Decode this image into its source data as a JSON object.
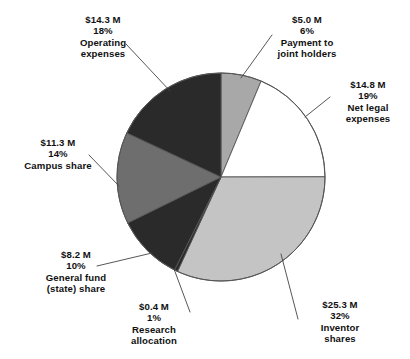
{
  "chart_data": {
    "type": "pie",
    "title": "",
    "subtitle": "",
    "xlabel": "",
    "ylabel": "",
    "legend_position": "callout-labels",
    "grid": false,
    "units": "$ millions",
    "start_angle_deg": 0,
    "direction": "clockwise",
    "categories": [
      "Payment to joint holders",
      "Net legal expenses",
      "Inventor shares",
      "Research allocation",
      "General fund (state) share",
      "Campus share",
      "Operating expenses"
    ],
    "values": [
      5.0,
      14.8,
      25.3,
      0.4,
      8.2,
      11.3,
      14.3
    ],
    "percentages": [
      6,
      19,
      32,
      1,
      10,
      14,
      18
    ],
    "colors": [
      "#a8a8a8",
      "#ffffff",
      "#c4c4c4",
      "#2a2a2a",
      "#2a2a2a",
      "#6e6e6e",
      "#2a2a2a"
    ],
    "slices": [
      {
        "name": "Payment to joint holders",
        "value": 5.0,
        "value_label": "$5.0 M",
        "percent": 6,
        "percent_label": "6%",
        "color": "#a8a8a8"
      },
      {
        "name": "Net legal expenses",
        "value": 14.8,
        "value_label": "$14.8 M",
        "percent": 19,
        "percent_label": "19%",
        "color": "#ffffff"
      },
      {
        "name": "Inventor shares",
        "value": 25.3,
        "value_label": "$25.3 M",
        "percent": 32,
        "percent_label": "32%",
        "color": "#c4c4c4"
      },
      {
        "name": "Research allocation",
        "value": 0.4,
        "value_label": "$0.4 M",
        "percent": 1,
        "percent_label": "1%",
        "color": "#2a2a2a"
      },
      {
        "name": "General fund (state) share",
        "value": 8.2,
        "value_label": "$8.2 M",
        "percent": 10,
        "percent_label": "10%",
        "color": "#2a2a2a"
      },
      {
        "name": "Campus share",
        "value": 11.3,
        "value_label": "$11.3 M",
        "percent": 14,
        "percent_label": "14%",
        "color": "#6e6e6e"
      },
      {
        "name": "Operating expenses",
        "value": 14.3,
        "value_label": "$14.3 M",
        "percent": 18,
        "percent_label": "18%",
        "color": "#2a2a2a"
      }
    ]
  },
  "labels": {
    "operating": {
      "amount": "$14.3 M",
      "percent": "18%",
      "name_line1": "Operating",
      "name_line2": "expenses"
    },
    "joint_holders": {
      "amount": "$5.0 M",
      "percent": "6%",
      "name_line1": "Payment to",
      "name_line2": "joint holders"
    },
    "net_legal": {
      "amount": "$14.8 M",
      "percent": "19%",
      "name_line1": "Net legal",
      "name_line2": "expenses"
    },
    "inventor": {
      "amount": "$25.3 M",
      "percent": "32%",
      "name_line1": "Inventor",
      "name_line2": "shares"
    },
    "research": {
      "amount": "$0.4 M",
      "percent": "1%",
      "name_line1": "Research",
      "name_line2": "allocation"
    },
    "general_fund": {
      "amount": "$8.2 M",
      "percent": "10%",
      "name_line1": "General fund",
      "name_line2": "(state) share"
    },
    "campus": {
      "amount": "$11.3 M",
      "percent": "14%",
      "name_line1": "Campus share",
      "name_line2": ""
    }
  },
  "style": {
    "outline_color": "#555555",
    "leader_color": "#444444",
    "background": "#ffffff"
  }
}
